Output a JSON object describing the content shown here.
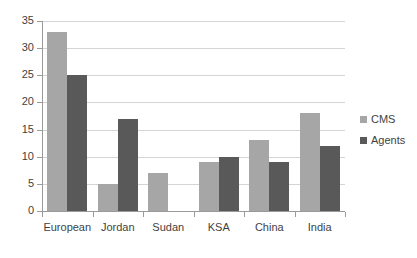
{
  "chart_data": {
    "type": "bar",
    "title": "",
    "subtitle": "",
    "xlabel": "",
    "ylabel": "",
    "categories": [
      "European",
      "Jordan",
      "Sudan",
      "KSA",
      "China",
      "India"
    ],
    "series": [
      {
        "name": "CMS",
        "color": "#a6a6a6",
        "values": [
          33,
          5,
          7,
          9,
          13,
          18
        ]
      },
      {
        "name": "Agents",
        "color": "#595959",
        "values": [
          25,
          17,
          0,
          10,
          9,
          12
        ]
      }
    ],
    "ylim": [
      0,
      35
    ],
    "ytick_step": 5,
    "ytick_labels": [
      "0",
      "5",
      "10",
      "15",
      "20",
      "25",
      "30",
      "35"
    ],
    "grid": true,
    "grid_axis": "y",
    "grid_color": "#d4d4d4",
    "legend_position": "right",
    "axis_color": "#9a9a9a",
    "background": "#ffffff",
    "annotations": []
  }
}
